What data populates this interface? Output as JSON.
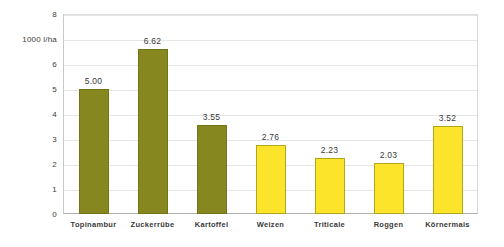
{
  "chart_data": {
    "type": "bar",
    "title": "",
    "subtitle": "",
    "xlabel": "",
    "ylabel": "1000 l/ha",
    "ylim": [
      0,
      8
    ],
    "y_ticks": [
      "0",
      "1",
      "2",
      "3",
      "4",
      "5",
      "6",
      "7",
      "8"
    ],
    "grid": true,
    "legend": false,
    "categories": [
      "Topinambur",
      "Zuckerrübe",
      "Kartoffel",
      "Weizen",
      "Triticale",
      "Roggen",
      "Körnermais"
    ],
    "values": [
      5.0,
      6.62,
      3.55,
      2.76,
      2.23,
      2.03,
      3.52
    ],
    "value_labels": [
      "5.00",
      "6.62",
      "3.55",
      "2.76",
      "2.23",
      "2.03",
      "3.52"
    ],
    "bar_colors": [
      "#87871f",
      "#87871f",
      "#87871f",
      "#fbe429",
      "#fbe429",
      "#fbe429",
      "#fbe429"
    ],
    "colors": {
      "olive": "#87871f",
      "yellow": "#fbe429",
      "grid": "#e6e6e6",
      "axis": "#b0b0b0",
      "text": "#3a3a3a",
      "background": "#ffffff"
    }
  },
  "axis": {
    "unit_label": "1000 l/ha",
    "unit_label_value": 7
  }
}
